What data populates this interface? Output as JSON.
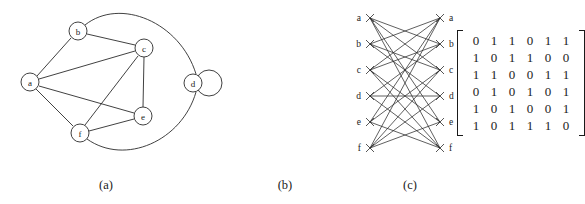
{
  "figure": {
    "ink_color": "#2b2b2b",
    "background_color": "#ffffff"
  },
  "captions": {
    "a": "(a)",
    "b": "(b)",
    "c": "(c)"
  },
  "graph": {
    "vertex_labels": [
      "a",
      "b",
      "c",
      "d",
      "e",
      "f"
    ],
    "vertices": [
      {
        "id": "a",
        "label": "a",
        "cx": 30,
        "cy": 82,
        "r": 9
      },
      {
        "id": "b",
        "label": "b",
        "cx": 78,
        "cy": 31,
        "r": 9
      },
      {
        "id": "c",
        "label": "c",
        "cx": 144,
        "cy": 48,
        "r": 9
      },
      {
        "id": "d",
        "label": "d",
        "cx": 193,
        "cy": 83,
        "r": 9
      },
      {
        "id": "e",
        "label": "e",
        "cx": 143,
        "cy": 116,
        "r": 9
      },
      {
        "id": "f",
        "label": "f",
        "cx": 80,
        "cy": 133,
        "r": 9
      }
    ],
    "straight_edges": [
      [
        "a",
        "b"
      ],
      [
        "a",
        "c"
      ],
      [
        "a",
        "e"
      ],
      [
        "a",
        "f"
      ],
      [
        "b",
        "c"
      ],
      [
        "c",
        "e"
      ],
      [
        "c",
        "f"
      ],
      [
        "e",
        "f"
      ]
    ],
    "arc_edges": [
      {
        "from": "b",
        "to": "d",
        "note": "upper arc"
      },
      {
        "from": "f",
        "to": "d",
        "note": "lower arc"
      }
    ],
    "self_loops": [
      {
        "at": "d",
        "loop_cx": 209,
        "loop_cy": 83,
        "loop_r": 13
      }
    ]
  },
  "matrix": {
    "rows": [
      [
        "0",
        "1",
        "1",
        "0",
        "1",
        "1"
      ],
      [
        "1",
        "0",
        "1",
        "1",
        "0",
        "0"
      ],
      [
        "1",
        "1",
        "0",
        "0",
        "1",
        "1"
      ],
      [
        "0",
        "1",
        "0",
        "1",
        "0",
        "1"
      ],
      [
        "1",
        "0",
        "1",
        "0",
        "0",
        "1"
      ],
      [
        "1",
        "0",
        "1",
        "1",
        "1",
        "0"
      ]
    ]
  },
  "bipartite": {
    "left_labels": [
      "a",
      "b",
      "c",
      "d",
      "e",
      "f"
    ],
    "right_labels": [
      "a",
      "b",
      "c",
      "d",
      "e",
      "f"
    ],
    "edges": [
      [
        "a",
        "b"
      ],
      [
        "a",
        "c"
      ],
      [
        "a",
        "e"
      ],
      [
        "a",
        "f"
      ],
      [
        "b",
        "a"
      ],
      [
        "b",
        "c"
      ],
      [
        "b",
        "d"
      ],
      [
        "c",
        "a"
      ],
      [
        "c",
        "b"
      ],
      [
        "c",
        "e"
      ],
      [
        "c",
        "f"
      ],
      [
        "d",
        "b"
      ],
      [
        "d",
        "d"
      ],
      [
        "d",
        "f"
      ],
      [
        "e",
        "a"
      ],
      [
        "e",
        "c"
      ],
      [
        "e",
        "f"
      ],
      [
        "f",
        "a"
      ],
      [
        "f",
        "c"
      ],
      [
        "f",
        "d"
      ],
      [
        "f",
        "e"
      ]
    ]
  }
}
